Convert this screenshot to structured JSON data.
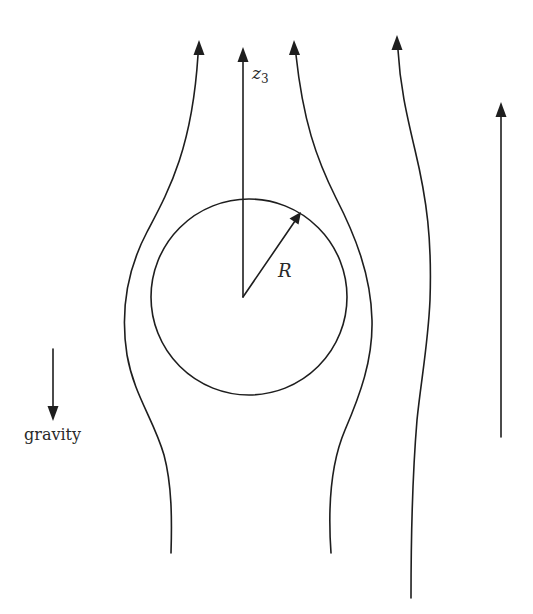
{
  "diagram": {
    "labels": {
      "axis_label": "z",
      "axis_subscript": "3",
      "radius_label": "R",
      "gravity_label": "gravity"
    },
    "colors": {
      "stroke": "#1e1e1e",
      "background": "#ffffff"
    },
    "elements": {
      "sphere": {
        "cx": 249,
        "cy": 297,
        "r": 98
      },
      "z3_axis": {
        "x": 243,
        "y_from": 297,
        "y_to": 47
      },
      "radius_arrow": {
        "from": [
          243,
          297
        ],
        "to": [
          300,
          213
        ]
      },
      "streamlines": [
        {
          "name": "left-streamline",
          "direction": "up"
        },
        {
          "name": "inner-right-streamline",
          "direction": "up"
        },
        {
          "name": "outer-right-streamline",
          "direction": "up"
        }
      ],
      "uniform_flow_arrow": {
        "x": 500,
        "y_from": 437,
        "y_to": 105,
        "direction": "up"
      },
      "gravity_arrow": {
        "x": 53,
        "y_from": 349,
        "y_to": 420,
        "direction": "down"
      }
    }
  }
}
